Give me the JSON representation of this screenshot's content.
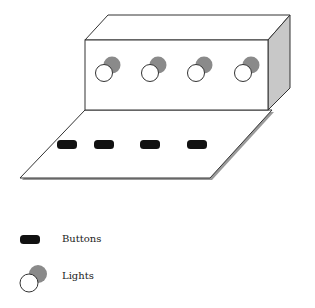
{
  "diagram": {
    "colors": {
      "stroke": "#333333",
      "face": "#ffffff",
      "side_face": "#c8c8c8",
      "light_back": "#8a8a8a",
      "light_front": "#ffffff",
      "button": "#111111",
      "shadow": "#9a9a9a"
    },
    "box": {
      "lights": [
        {
          "id": "light-1",
          "cx": 104,
          "cy": 73
        },
        {
          "id": "light-2",
          "cx": 150,
          "cy": 73
        },
        {
          "id": "light-3",
          "cx": 196,
          "cy": 73
        },
        {
          "id": "light-4",
          "cx": 243,
          "cy": 73
        }
      ]
    },
    "platform": {
      "buttons": [
        {
          "id": "button-1",
          "x": 57,
          "y": 140
        },
        {
          "id": "button-2",
          "x": 94,
          "y": 140
        },
        {
          "id": "button-3",
          "x": 140,
          "y": 140
        },
        {
          "id": "button-4",
          "x": 187,
          "y": 140
        }
      ]
    }
  },
  "legend": {
    "items": [
      {
        "icon": "button-icon",
        "label": "Buttons"
      },
      {
        "icon": "light-icon",
        "label": "Lights"
      }
    ]
  }
}
